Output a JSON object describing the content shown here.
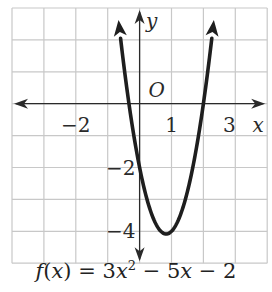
{
  "chart_data": {
    "type": "line",
    "title": "",
    "caption": "f(x) = 3x^2 - 5x - 2",
    "function": "3*x^2 - 5*x - 2",
    "xlabel": "x",
    "ylabel": "y",
    "origin_label": "O",
    "xlim": [
      -4,
      4
    ],
    "ylim": [
      -5,
      3
    ],
    "grid": true,
    "x_tick_labels": [
      {
        "value": -2,
        "label": "−2"
      },
      {
        "value": 1,
        "label": "1"
      },
      {
        "value": 3,
        "label": "3"
      }
    ],
    "y_tick_labels": [
      {
        "value": -2,
        "label": "−2"
      },
      {
        "value": -4,
        "label": "−4"
      }
    ],
    "series": [
      {
        "name": "f(x)",
        "x": [
          -0.5,
          -0.33,
          0,
          0.5,
          0.833,
          1,
          1.5,
          2,
          2.3
        ],
        "y": [
          0.75,
          0,
          -2,
          -3.75,
          -4.083,
          -4,
          -2.75,
          0,
          2.37
        ]
      }
    ],
    "vertex": {
      "x": 0.833,
      "y": -4.083
    },
    "x_intercepts": [
      -0.333,
      2
    ],
    "y_intercept": -2
  },
  "caption": {
    "f": "f",
    "open": "(",
    "x": "x",
    "close": ")",
    "eq": " = 3",
    "x2": "x",
    "sup": "2",
    "mid": " − 5",
    "x3": "x",
    "end": " − 2"
  },
  "colors": {
    "grid": "#c8c8c8",
    "axis": "#2a2a2a",
    "curve": "#1e1e1e",
    "background": "#ffffff"
  }
}
